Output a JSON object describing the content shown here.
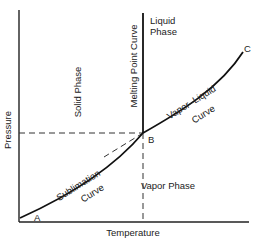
{
  "diagram": {
    "type": "phase-diagram",
    "axes": {
      "x_label": "Temperature",
      "y_label": "Pressure"
    },
    "regions": {
      "solid": "Solid Phase",
      "liquid_line1": "Liquid",
      "liquid_line2": "Phase",
      "vapor": "Vapor Phase"
    },
    "curves": {
      "melting": "Melting Point Curve",
      "sublimation_line1": "Sublimation",
      "sublimation_line2": "Curve",
      "vapor_liquid_line1": "Vapor–Liquid",
      "vapor_liquid_line2": "Curve"
    },
    "points": {
      "a": "A",
      "b": "B",
      "c": "C"
    },
    "colors": {
      "line": "#111111",
      "text": "#222222",
      "background": "#ffffff"
    }
  }
}
